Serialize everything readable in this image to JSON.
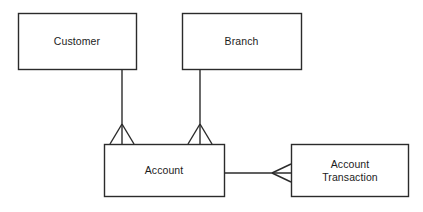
{
  "diagram": {
    "type": "entity-relationship-diagram",
    "notation": "crows-foot",
    "background_color": "#ffffff",
    "stroke_color": "#2b2b2b",
    "text_color": "#1c1c1c",
    "entities": [
      {
        "id": "customer",
        "label": "Customer",
        "x": 18,
        "y": 13,
        "width": 118,
        "height": 56
      },
      {
        "id": "branch",
        "label": "Branch",
        "x": 182,
        "y": 13,
        "width": 119,
        "height": 56
      },
      {
        "id": "account",
        "label": "Account",
        "x": 104,
        "y": 144,
        "width": 120,
        "height": 53
      },
      {
        "id": "account-transaction",
        "label": "Account\nTransaction",
        "x": 291,
        "y": 144,
        "width": 118,
        "height": 53
      }
    ],
    "relationships": [
      {
        "id": "customer-account",
        "from": "customer",
        "to": "account",
        "from_cardinality": "one",
        "to_cardinality": "many",
        "orientation": "vertical",
        "line": {
          "x1": 122,
          "y1": 69,
          "x2": 122,
          "y2": 144
        },
        "crows_foot": {
          "apex_x": 122,
          "apex_y": 124,
          "base_y": 144,
          "spread": 12
        }
      },
      {
        "id": "branch-account",
        "from": "branch",
        "to": "account",
        "from_cardinality": "one",
        "to_cardinality": "many",
        "orientation": "vertical",
        "line": {
          "x1": 200,
          "y1": 69,
          "x2": 200,
          "y2": 144
        },
        "crows_foot": {
          "apex_x": 200,
          "apex_y": 124,
          "base_y": 144,
          "spread": 12
        }
      },
      {
        "id": "account-accounttransaction",
        "from": "account",
        "to": "account-transaction",
        "from_cardinality": "one",
        "to_cardinality": "many",
        "orientation": "horizontal",
        "line": {
          "x1": 224,
          "y1": 173,
          "x2": 291,
          "y2": 173
        },
        "crows_foot": {
          "apex_x": 272,
          "apex_y": 173,
          "base_x": 291,
          "spread": 9
        }
      }
    ]
  }
}
